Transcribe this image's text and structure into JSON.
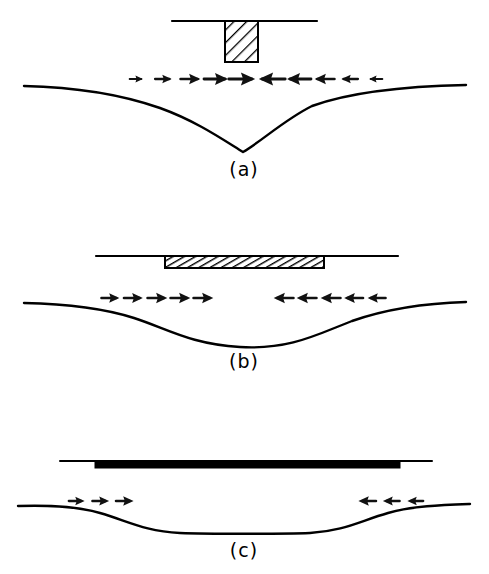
{
  "figure": {
    "background_color": "#ffffff",
    "ink_color": "#000000",
    "width": 489,
    "height": 574,
    "panel_count": 3
  },
  "panels": [
    {
      "id": "a",
      "label": "(a)",
      "label_x": 244,
      "label_y": 176,
      "description": "Narrow rigid punch on elastic half-space producing a deep narrow V-shaped settlement trough",
      "loading_element": {
        "name": "rigid-punch",
        "shape": "rectangle",
        "fill": "diagonal-hatch",
        "hatch_angle_deg": 45,
        "hatch_spacing_px": 6,
        "x": 225,
        "y": 21,
        "width": 33,
        "height": 41
      },
      "surface_line": {
        "name": "surface-line",
        "x1": 172,
        "x2": 317,
        "y": 21,
        "stroke_width": 2.2
      },
      "settlement_curve": {
        "name": "settlement-curve-a",
        "baseline_y": 85,
        "min_x": 243,
        "min_y": 152,
        "depth_px": 67,
        "shape": "narrow-deep-v",
        "stroke_width": 2.4,
        "left_end_x": 24,
        "right_end_x": 466,
        "path": "M24,86 C70,87 120,94 160,108 C196,121 222,139 243,152 C262,141 284,120 312,106 C356,90 418,86 466,85"
      },
      "arrows": {
        "name": "arrow-row-a",
        "y": 79,
        "direction_left_group": "right",
        "direction_right_group": "left",
        "note": "Arrow size grows toward the centre of the loaded area",
        "right_pointing": [
          {
            "x": 136,
            "scale": 0.58
          },
          {
            "x": 163,
            "scale": 0.72
          },
          {
            "x": 190,
            "scale": 0.86
          },
          {
            "x": 216,
            "scale": 1.0
          },
          {
            "x": 242,
            "scale": 1.1
          }
        ],
        "left_pointing": [
          {
            "x": 272,
            "scale": 1.1
          },
          {
            "x": 299,
            "scale": 1.0
          },
          {
            "x": 325,
            "scale": 0.86
          },
          {
            "x": 350,
            "scale": 0.72
          },
          {
            "x": 376,
            "scale": 0.58
          }
        ]
      }
    },
    {
      "id": "b",
      "label": "(b)",
      "label_x": 244,
      "label_y": 368,
      "description": "Wide semi-flexible hatched strip producing a broad shallow smooth settlement basin",
      "loading_element": {
        "name": "semi-flexible-strip",
        "shape": "rectangle",
        "fill": "diagonal-hatch",
        "hatch_angle_deg": 60,
        "hatch_spacing_px": 4,
        "x": 165,
        "y": 256,
        "width": 159,
        "height": 12
      },
      "surface_line": {
        "name": "surface-line",
        "x1": 96,
        "x2": 398,
        "y": 256,
        "stroke_width": 2.2
      },
      "settlement_curve": {
        "name": "settlement-curve-b",
        "baseline_y": 302,
        "min_x": 240,
        "min_y": 347,
        "depth_px": 45,
        "shape": "broad-shallow-basin",
        "stroke_width": 2.4,
        "left_end_x": 24,
        "right_end_x": 466,
        "path": "M24,303 C70,304 106,309 134,318 C168,329 190,344 240,347 C290,350 318,334 352,321 C392,307 432,303 466,302"
      },
      "arrows": {
        "name": "arrow-row-b",
        "y": 298,
        "direction_left_group": "right",
        "direction_right_group": "left",
        "note": "Uniform arrow size with a gap across the middle of the strip",
        "right_pointing": [
          {
            "x": 110,
            "scale": 0.78
          },
          {
            "x": 133,
            "scale": 0.82
          },
          {
            "x": 157,
            "scale": 0.86
          },
          {
            "x": 180,
            "scale": 0.86
          },
          {
            "x": 203,
            "scale": 0.86
          }
        ],
        "left_pointing": [
          {
            "x": 284,
            "scale": 0.86
          },
          {
            "x": 307,
            "scale": 0.86
          },
          {
            "x": 331,
            "scale": 0.86
          },
          {
            "x": 354,
            "scale": 0.82
          },
          {
            "x": 377,
            "scale": 0.78
          }
        ]
      }
    },
    {
      "id": "c",
      "label": "(c)",
      "label_x": 244,
      "label_y": 557,
      "description": "Fully flexible uniform load shown as a solid black bar producing a wide flat-bottomed settlement trough",
      "loading_element": {
        "name": "flexible-load-bar",
        "shape": "rectangle",
        "fill": "solid",
        "fill_color": "#000000",
        "x": 95,
        "y": 462,
        "width": 305,
        "height": 6
      },
      "surface_line": {
        "name": "surface-line",
        "x1": 60,
        "x2": 432,
        "y": 461,
        "stroke_width": 2.0
      },
      "settlement_curve": {
        "name": "settlement-curve-c",
        "baseline_y": 505,
        "min_x": 244,
        "min_y": 533,
        "depth_px": 28,
        "shape": "wide-flat-bottomed",
        "stroke_width": 2.4,
        "left_end_x": 18,
        "right_end_x": 470,
        "path": "M18,506 C48,505 76,506 100,513 C128,521 144,531 180,533 C206,534 284,534 310,533 C344,531 360,521 388,513 C412,506 442,505 470,504"
      },
      "arrows": {
        "name": "arrow-row-c",
        "y": 501,
        "direction_left_group": "right",
        "direction_right_group": "left",
        "note": "Only three small arrows per side near the outer edges of the loaded strip",
        "right_pointing": [
          {
            "x": 76,
            "scale": 0.72
          },
          {
            "x": 100,
            "scale": 0.76
          },
          {
            "x": 124,
            "scale": 0.8
          }
        ],
        "left_pointing": [
          {
            "x": 368,
            "scale": 0.8
          },
          {
            "x": 392,
            "scale": 0.76
          },
          {
            "x": 416,
            "scale": 0.72
          }
        ]
      }
    }
  ]
}
